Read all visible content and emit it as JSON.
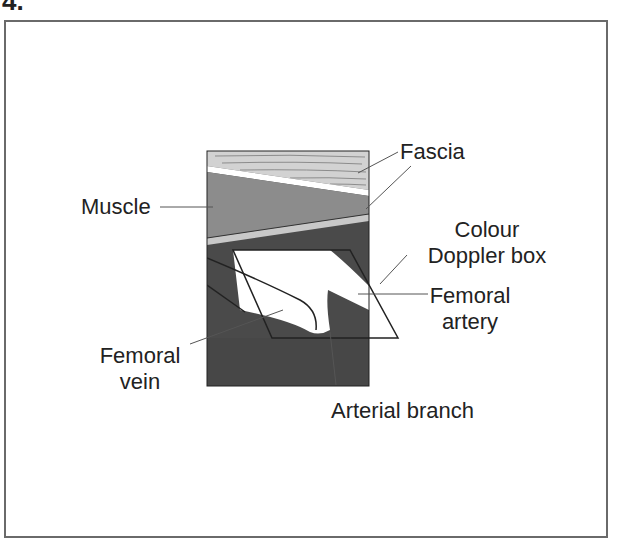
{
  "figure": {
    "number": "4.",
    "labels": {
      "fascia": "Fascia",
      "muscle": "Muscle",
      "colour_doppler_box_line1": "Colour",
      "colour_doppler_box_line2": "Doppler box",
      "femoral_artery_line1": "Femoral",
      "femoral_artery_line2": "artery",
      "femoral_vein_line1": "Femoral",
      "femoral_vein_line2": "vein",
      "arterial_branch": "Arterial branch"
    },
    "colors": {
      "fascia_layer": "#d2d2d2",
      "muscle_layer": "#8c8c8c",
      "deep_tissue": "#4a4a4a",
      "vessel_flow": "#ffffff",
      "frame": "#6a6a6a",
      "text": "#222222"
    }
  }
}
